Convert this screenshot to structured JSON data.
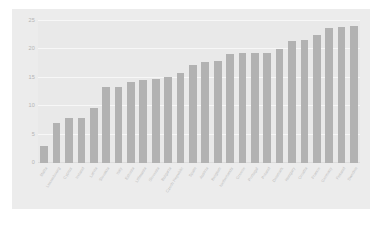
{
  "chart_data": {
    "type": "bar",
    "title": "",
    "subtitle": "",
    "xlabel": "",
    "ylabel": "",
    "ylim": [
      0,
      25
    ],
    "yticks": [
      0,
      5,
      10,
      15,
      20,
      25
    ],
    "grid": true,
    "legend": null,
    "orientation": "vertical",
    "bar_color": "#b2b2b2",
    "panel_color": "#ececec",
    "plot_color": "#e9e9e9",
    "gridline_color": "#f7f7f7",
    "tick_text_color": "#b4b4b4",
    "categories": [
      "Malta",
      "Luxembourg",
      "Cyprus",
      "Ireland",
      "Latvia",
      "Slovakia",
      "Italy",
      "Estonia",
      "Lithuania",
      "Slovenia",
      "Bulgaria",
      "Czech Republic",
      "Spain",
      "Austria",
      "Belgium",
      "Netherlands",
      "Greece",
      "Portugal",
      "Poland",
      "Denmark",
      "Hungary",
      "Croatia",
      "France",
      "Germany",
      "Finland",
      "Sweden"
    ],
    "values": [
      3.0,
      7.0,
      8.0,
      8.0,
      9.7,
      13.4,
      13.4,
      14.2,
      14.6,
      14.8,
      15.2,
      15.9,
      17.3,
      17.8,
      18.0,
      19.2,
      19.3,
      19.3,
      19.3,
      20.1,
      21.4,
      21.7,
      22.5,
      23.8,
      24.0,
      24.1
    ]
  },
  "caption": {
    "text": ""
  }
}
